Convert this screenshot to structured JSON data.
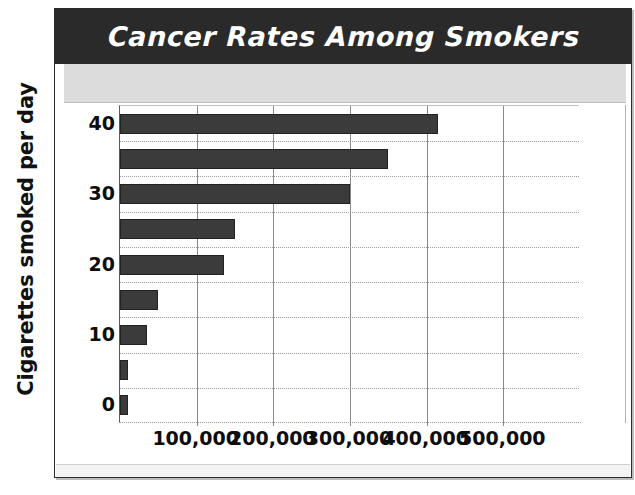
{
  "chart_data": {
    "type": "bar",
    "orientation": "horizontal",
    "title": "Cancer Rates Among Smokers",
    "xlabel": "",
    "ylabel": "Cigarettes smoked per day",
    "categories": [
      0,
      5,
      10,
      15,
      20,
      25,
      30,
      35,
      40
    ],
    "values": [
      10000,
      10000,
      35000,
      50000,
      135000,
      150000,
      300000,
      350000,
      415000
    ],
    "xlim": [
      0,
      600000
    ],
    "ylim": [
      -2.5,
      42.5
    ],
    "xticks": [
      100000,
      200000,
      300000,
      400000,
      500000
    ],
    "xtick_labels": [
      "100,000",
      "200,000",
      "300,000",
      "400,000",
      "500,000"
    ],
    "yticks": [
      0,
      10,
      20,
      30,
      40
    ],
    "ytick_labels": [
      "0",
      "10",
      "20",
      "30",
      "40"
    ],
    "grid": true,
    "legend": "none",
    "bar_color": "#3b3b3b",
    "title_background": "#2a2a2a",
    "title_color": "#ffffff",
    "band_color": "#dcdcdc"
  },
  "axes": {
    "y_title": "Cigarettes smoked per day"
  }
}
